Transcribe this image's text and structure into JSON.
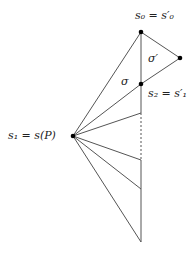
{
  "labels": {
    "s0": "s₀ = s′₀",
    "sigma_prime": "σ′",
    "sigma": "σ",
    "s2": "s₂ = s′₁",
    "s1": "s₁ = s(P)"
  },
  "colors": {
    "line": "#555555",
    "point": "#000000"
  },
  "points": {
    "s0": [
      141,
      32
    ],
    "right": [
      180,
      58
    ],
    "s2": [
      141,
      84
    ],
    "s1": [
      73,
      136
    ]
  }
}
